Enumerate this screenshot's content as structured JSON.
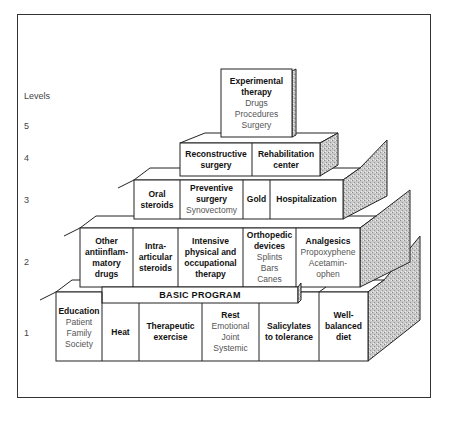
{
  "axis": {
    "title": "Levels",
    "levels": [
      "5",
      "4",
      "3",
      "2",
      "1"
    ]
  },
  "level5": [
    {
      "title": "Experimental therapy",
      "title_lines": [
        "Experimental",
        "therapy"
      ],
      "items": [
        "Drugs",
        "Procedures",
        "Surgery"
      ]
    }
  ],
  "level4": [
    {
      "title_lines": [
        "Reconstructive",
        "surgery"
      ],
      "items": []
    },
    {
      "title_lines": [
        "Rehabilitation",
        "center"
      ],
      "items": []
    }
  ],
  "level3": [
    {
      "title_lines": [
        "Oral",
        "steroids"
      ],
      "items": []
    },
    {
      "title_lines": [
        "Preventive",
        "surgery"
      ],
      "items": [
        "Synovectomy"
      ]
    },
    {
      "title_lines": [
        "Gold"
      ],
      "items": []
    },
    {
      "title_lines": [
        "Hospitalization"
      ],
      "items": []
    }
  ],
  "level2": [
    {
      "title_lines": [
        "Other",
        "antiinflam-",
        "matory",
        "drugs"
      ],
      "items": []
    },
    {
      "title_lines": [
        "Intra-",
        "articular",
        "steroids"
      ],
      "items": []
    },
    {
      "title_lines": [
        "Intensive",
        "physical and",
        "occupational",
        "therapy"
      ],
      "items": []
    },
    {
      "title_lines": [
        "Orthopedic",
        "devices"
      ],
      "items": [
        "Splints",
        "Bars",
        "Canes"
      ]
    },
    {
      "title_lines": [
        "Analgesics"
      ],
      "items": [
        "Propoxyphene",
        "Acetamin-",
        "ophen"
      ]
    }
  ],
  "level1": {
    "banner": "BASIC PROGRAM",
    "cells": [
      {
        "title_lines": [
          "Education"
        ],
        "items": [
          "Patient",
          "Family",
          "Society"
        ]
      },
      {
        "title_lines": [
          "Heat"
        ],
        "items": []
      },
      {
        "title_lines": [
          "Therapeutic",
          "exercise"
        ],
        "items": []
      },
      {
        "title_lines": [
          "Rest"
        ],
        "items": [
          "Emotional",
          "Joint",
          "Systemic"
        ]
      },
      {
        "title_lines": [
          "Salicylates",
          "to tolerance"
        ],
        "items": []
      },
      {
        "title_lines": [
          "Well-",
          "balanced",
          "diet"
        ],
        "items": []
      }
    ]
  }
}
